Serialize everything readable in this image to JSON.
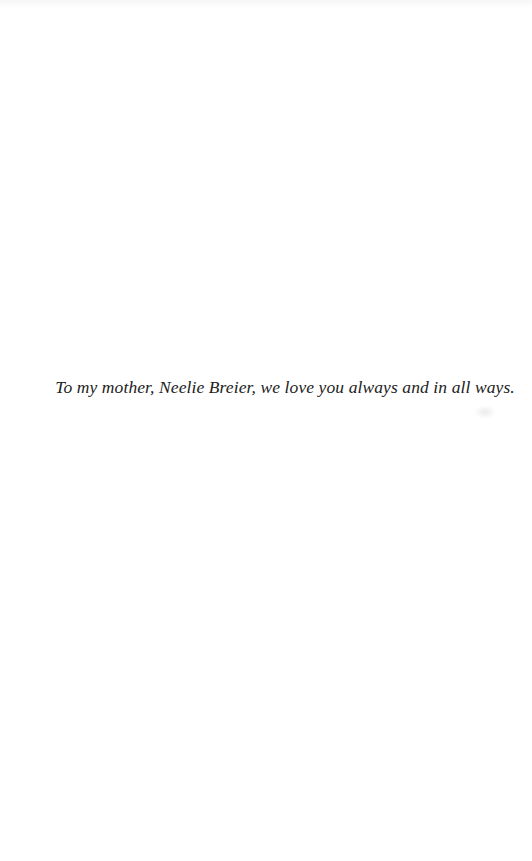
{
  "page": {
    "dedication": "To my mother, Neelie Breier, we love you always and in all ways.",
    "colors": {
      "background": "#ffffff",
      "text": "#222222"
    }
  }
}
